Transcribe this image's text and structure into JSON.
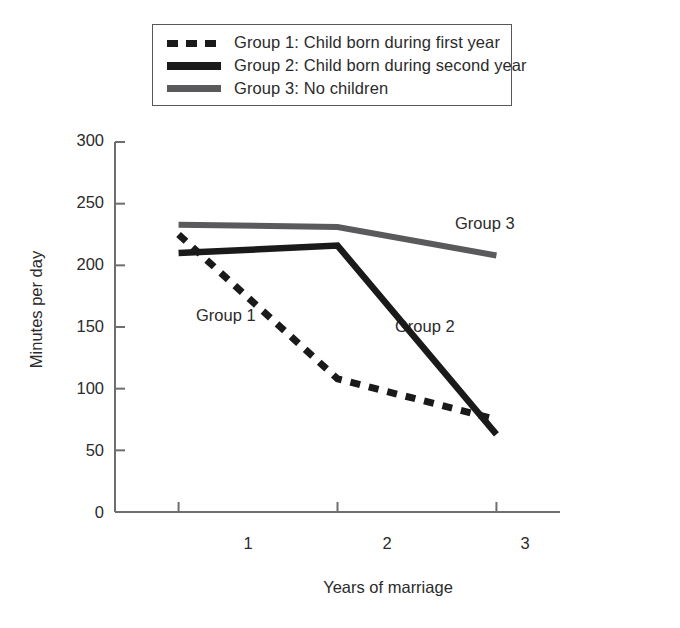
{
  "chart_data": {
    "type": "line",
    "title": "",
    "xlabel": "Years of marriage",
    "ylabel": "Minutes per day",
    "x": [
      1,
      2,
      3
    ],
    "categories": [
      "1",
      "2",
      "3"
    ],
    "xlim": [
      0.6,
      3.4
    ],
    "ylim": [
      0,
      300
    ],
    "yticks": [
      0,
      50,
      100,
      150,
      200,
      250,
      300
    ],
    "ytick_labels": [
      "0",
      "50",
      "100",
      "150",
      "200",
      "250",
      "300"
    ],
    "xticks": [
      1,
      2,
      3
    ],
    "xtick_labels": [
      "1",
      "2",
      "3"
    ],
    "grid": false,
    "legend_position": "top",
    "series": [
      {
        "name": "Group 1",
        "legend_label": "Group 1: Child born during first year",
        "style": "dashed",
        "color": "#1a1a1a",
        "values": [
          225,
          108,
          75
        ]
      },
      {
        "name": "Group 2",
        "legend_label": "Group 2: Child born during second year",
        "style": "solid-thick",
        "color": "#1a1a1a",
        "values": [
          210,
          216,
          63
        ]
      },
      {
        "name": "Group 3",
        "legend_label": "Group 3: No children",
        "style": "solid",
        "color": "#5a5a5c",
        "values": [
          233,
          231,
          208
        ]
      }
    ],
    "annotations": [
      {
        "text": "Group 1",
        "x": 1.15,
        "y": 160
      },
      {
        "text": "Group 2",
        "x": 2.15,
        "y": 175
      },
      {
        "text": "Group 3",
        "x": 2.5,
        "y": 243
      }
    ]
  },
  "axes": {
    "y_title": "Minutes per day",
    "x_title": "Years of marriage",
    "y_ticks": [
      "300",
      "250",
      "200",
      "150",
      "100",
      "50",
      "0"
    ],
    "x_ticks": [
      "1",
      "2",
      "3"
    ]
  },
  "legend": {
    "entries": [
      {
        "label": "Group 1: Child born during first year",
        "swatch": "dashed-line-swatch"
      },
      {
        "label": "Group 2: Child born during second year",
        "swatch": "solid-thick-line-swatch"
      },
      {
        "label": "Group 3: No children",
        "swatch": "solid-gray-line-swatch"
      }
    ]
  },
  "series_labels": {
    "group1": "Group 1",
    "group2": "Group 2",
    "group3": "Group 3"
  }
}
